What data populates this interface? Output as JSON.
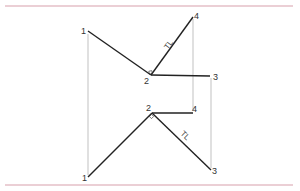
{
  "diagram": {
    "type": "descriptive-geometry-projection",
    "colors": {
      "border_line": "#d8a0ac",
      "object_line": "#222222",
      "projector_line": "#a8a8a8",
      "label": "#333333"
    },
    "top_view": {
      "points": [
        {
          "id": "1",
          "label": "1",
          "x": 88,
          "y": 31
        },
        {
          "id": "2",
          "label": "2",
          "x": 151,
          "y": 75
        },
        {
          "id": "3",
          "label": "3",
          "x": 210,
          "y": 76
        },
        {
          "id": "4",
          "label": "4",
          "x": 193,
          "y": 17
        }
      ],
      "true_length_label": "TL",
      "true_length_segment": "2-4"
    },
    "bottom_view": {
      "points": [
        {
          "id": "1",
          "label": "1",
          "x": 88,
          "y": 177
        },
        {
          "id": "2",
          "label": "2",
          "x": 152,
          "y": 113
        },
        {
          "id": "3",
          "label": "3",
          "x": 211,
          "y": 170
        },
        {
          "id": "4",
          "label": "4",
          "x": 193,
          "y": 113
        }
      ],
      "true_length_label": "TL",
      "true_length_segment": "2-3"
    }
  }
}
